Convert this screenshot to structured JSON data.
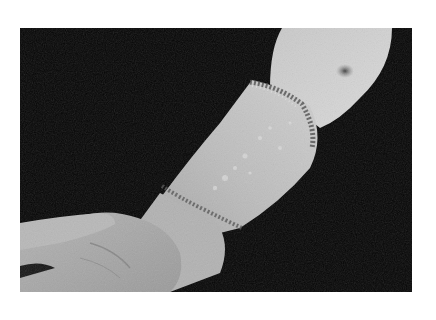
{
  "figure": {
    "alt": "Grayscale clinical photograph of a forearm and hand against a black background, showing a sharply demarcated scaly band of skin from the wrist to below the elbow",
    "colors": {
      "page_background": "#ffffff",
      "photo_background": "#050505",
      "skin_light": "#d6d6d6",
      "skin_mid": "#a9a9a9",
      "skin_shadow": "#6e6e6e",
      "lesion_edge": "#4a4a4a"
    }
  }
}
